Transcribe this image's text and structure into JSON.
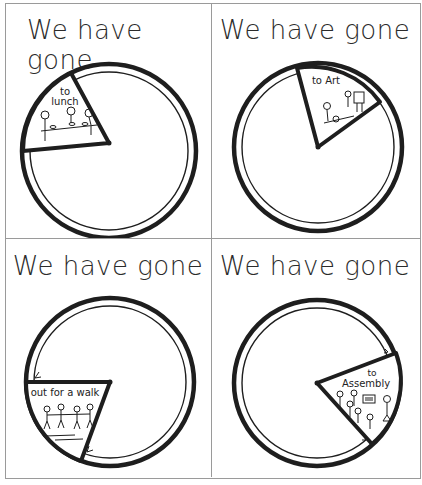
{
  "worksheet": {
    "cards": [
      {
        "title": "We have gone",
        "label_line1": "to",
        "label_line2": "lunch",
        "picture": "people-eating-at-table"
      },
      {
        "title": "We have gone",
        "label_line1": "to Art",
        "label_line2": "",
        "picture": "child-painting-at-easel"
      },
      {
        "title": "We have gone",
        "label_line1": "out for a walk",
        "label_line2": "",
        "picture": "children-holding-hands"
      },
      {
        "title": "We have gone",
        "label_line1": "to",
        "label_line2": "Assembly",
        "picture": "children-with-flag"
      }
    ],
    "colors": {
      "ink": "#1e1e1e",
      "border": "#9a9a9a",
      "paper": "#ffffff"
    }
  }
}
